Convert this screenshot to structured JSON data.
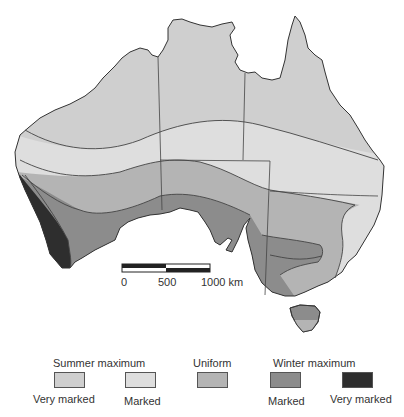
{
  "map": {
    "subject": "Australia rainfall seasonality zones",
    "colors": {
      "summer_very_marked": "#cfcfcf",
      "summer_marked": "#dedede",
      "uniform": "#b4b4b4",
      "winter_marked": "#8c8c8c",
      "winter_very_marked": "#2e2e2e",
      "outline": "#333333",
      "border": "#444444"
    }
  },
  "scale_bar": {
    "labels": [
      "0",
      "500",
      "1000 km"
    ]
  },
  "legend": {
    "groups": {
      "summer": "Summer maximum",
      "uniform": "Uniform",
      "winter": "Winter maximum"
    },
    "items": [
      {
        "label": "Very marked",
        "color": "#cfcfcf",
        "group": "Summer maximum"
      },
      {
        "label": "Marked",
        "color": "#dedede",
        "group": "Summer maximum"
      },
      {
        "label": "",
        "color": "#b4b4b4",
        "group": "Uniform"
      },
      {
        "label": "Marked",
        "color": "#8c8c8c",
        "group": "Winter maximum"
      },
      {
        "label": "Very marked",
        "color": "#2e2e2e",
        "group": "Winter maximum"
      }
    ]
  }
}
